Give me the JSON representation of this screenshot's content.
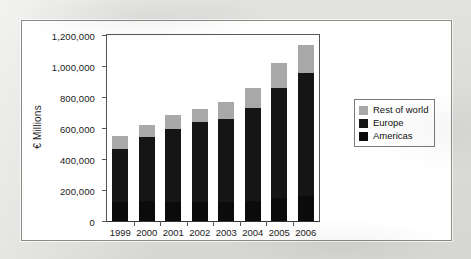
{
  "chart_data": {
    "type": "bar",
    "subtype": "stacked-vertical",
    "title": "",
    "subtitle": "",
    "xlabel": "",
    "ylabel": "€ Millions",
    "categories": [
      "1999",
      "2000",
      "2001",
      "2002",
      "2003",
      "2004",
      "2005",
      "2006"
    ],
    "ylim": [
      0,
      1200000
    ],
    "ytick_values": [
      0,
      200000,
      400000,
      600000,
      800000,
      1000000,
      1200000
    ],
    "ytick_labels": [
      "0",
      "200,000",
      "400,000",
      "600,000",
      "800,000",
      "1,000,000",
      "1,200,000"
    ],
    "grid": false,
    "legend_position": "right",
    "series": [
      {
        "name": "Americas",
        "color": "#0b0b0b",
        "values": [
          120000,
          130000,
          125000,
          125000,
          125000,
          128000,
          150000,
          160000
        ]
      },
      {
        "name": "Europe",
        "color": "#151515",
        "values": [
          345000,
          410000,
          470000,
          515000,
          530000,
          602000,
          705000,
          795000
        ]
      },
      {
        "name": "Rest of world",
        "color": "#a8a8a8",
        "values": [
          85000,
          80000,
          90000,
          85000,
          110000,
          130000,
          165000,
          180000
        ]
      }
    ],
    "totals": [
      550000,
      620000,
      685000,
      725000,
      765000,
      860000,
      1020000,
      1135000
    ]
  },
  "legend": {
    "items": [
      {
        "label": "Rest of world",
        "color": "#a8a8a8"
      },
      {
        "label": "Europe",
        "color": "#151515"
      },
      {
        "label": "Americas",
        "color": "#0b0b0b"
      }
    ]
  }
}
